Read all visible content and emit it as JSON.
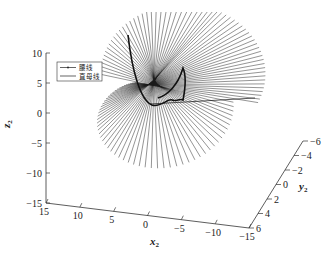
{
  "chart_data": {
    "type": "line",
    "subtype": "3d-ruled-surface",
    "title": "",
    "xlabel": "x2",
    "ylabel": "y2",
    "zlabel": "z2",
    "xlim": [
      -15,
      15
    ],
    "ylim": [
      -6,
      6
    ],
    "zlim": [
      -15,
      10
    ],
    "x_ticks": [
      "15",
      "10",
      "5",
      "0",
      "-5",
      "-10",
      "-15"
    ],
    "y_ticks": [
      "6",
      "4",
      "2",
      "0",
      "-2",
      "-4",
      "-6"
    ],
    "z_ticks": [
      "10",
      "5",
      "0",
      "-5",
      "-10",
      "-15"
    ],
    "grid": false,
    "legend_position": "upper-left",
    "legend": [
      {
        "label": "腰线",
        "style": "line-with-dot-marker"
      },
      {
        "label": "直母线",
        "style": "line"
      }
    ],
    "series": [
      {
        "name": "腰线",
        "description": "waist (striction) curve of ruled surface, thick dark curve near center"
      },
      {
        "name": "直母线",
        "description": "straight generator lines radiating from waist curve",
        "count": 60
      }
    ]
  },
  "axes": {
    "x_label_main": "x",
    "x_label_sub": "2",
    "y_label_main": "y",
    "y_label_sub": "2",
    "z_label_main": "z",
    "z_label_sub": "2"
  },
  "legend": {
    "item1": "腰线",
    "item2": "直母线"
  },
  "colors": {
    "line": "#1a1a1a",
    "axis": "#333333",
    "background": "#ffffff"
  }
}
